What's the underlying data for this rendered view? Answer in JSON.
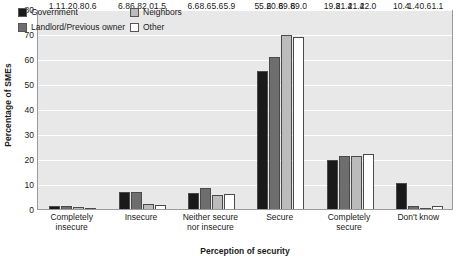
{
  "chart_data": {
    "type": "bar",
    "title": "",
    "xlabel": "Perception of security",
    "ylabel": "Percentage of SMEs",
    "ylim": [
      0,
      80
    ],
    "ytick_step": 10,
    "yticks": [
      0,
      10,
      20,
      30,
      40,
      50,
      60,
      70,
      80
    ],
    "grid": true,
    "legend_position": "top-left-inside",
    "categories": [
      "Completely insecure",
      "Insecure",
      "Neither secure nor insecure",
      "Secure",
      "Completely secure",
      "Don't know"
    ],
    "category_lines": [
      [
        "Completely",
        "insecure"
      ],
      [
        "Insecure",
        ""
      ],
      [
        "Neither secure",
        "nor insecure"
      ],
      [
        "Secure",
        ""
      ],
      [
        "Completely",
        "secure"
      ],
      [
        "Don't know",
        ""
      ]
    ],
    "series": [
      {
        "name": "Government",
        "color": "#1a1a1a",
        "values": [
          1.1,
          6.8,
          6.6,
          55.2,
          19.8,
          10.4
        ]
      },
      {
        "name": "Landlord/Previous owner",
        "color": "#6e6e6e",
        "values": [
          1.2,
          6.8,
          8.6,
          60.8,
          21.4,
          1.4
        ]
      },
      {
        "name": "Neighbors",
        "color": "#bbbbbb",
        "values": [
          0.8,
          2.0,
          5.6,
          69.8,
          21.4,
          0.6
        ]
      },
      {
        "name": "Other",
        "color": "#ffffff",
        "values": [
          0.6,
          1.5,
          5.9,
          69.0,
          22.0,
          1.1
        ]
      }
    ]
  },
  "axes": {
    "y_title": "Percentage of SMEs",
    "x_title": "Perception of security",
    "y_tick_labels": [
      "80",
      "70",
      "60",
      "50",
      "40",
      "30",
      "20",
      "10",
      "0"
    ]
  },
  "legend": {
    "items": [
      {
        "label": "Government",
        "color": "#1a1a1a"
      },
      {
        "label": "Neighbors",
        "color": "#bbbbbb"
      },
      {
        "label": "Landlord/Previous owner",
        "color": "#6e6e6e"
      },
      {
        "label": "Other",
        "color": "#ffffff"
      }
    ]
  },
  "style": {
    "plot_background": "#e8e8e8",
    "gridline_color": "#ffffff",
    "axis_color": "#9a9a9a",
    "text_color": "#1a1a1a"
  }
}
